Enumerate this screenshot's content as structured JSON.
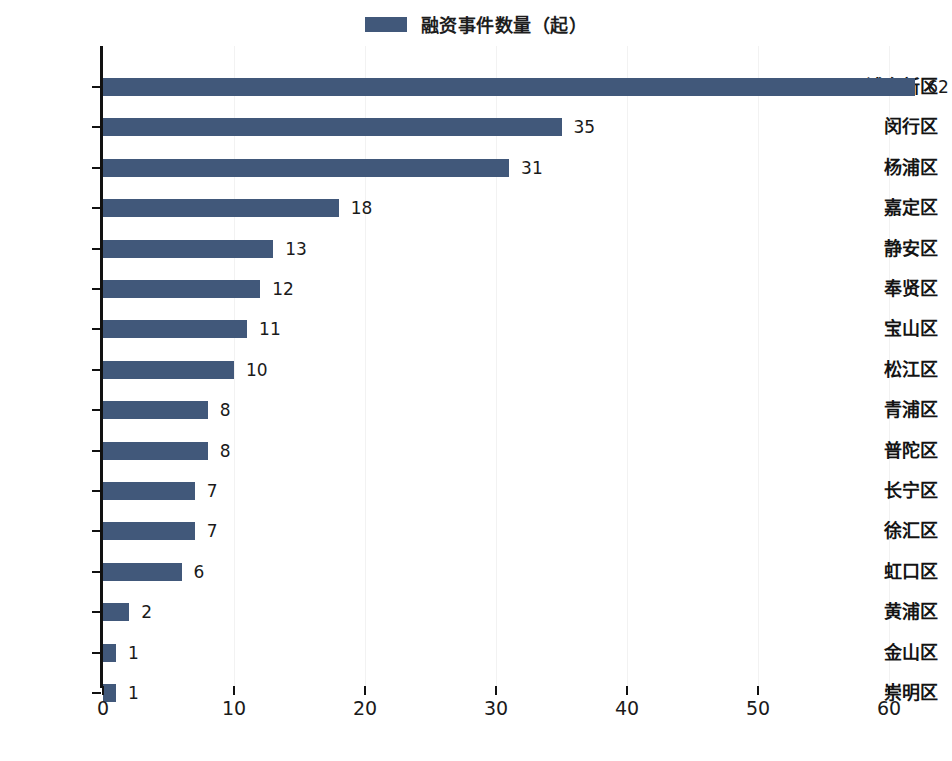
{
  "legend": {
    "entries": [
      {
        "label": "融资事件数量（起）",
        "color": "#41587a"
      }
    ]
  },
  "axis": {
    "x_ticks": [
      "0",
      "10",
      "20",
      "30",
      "40",
      "50",
      "60"
    ],
    "x_tick_values": [
      0,
      10,
      20,
      30,
      40,
      50,
      60
    ]
  },
  "chart_data": {
    "type": "bar",
    "orientation": "horizontal",
    "title": "",
    "subtitle": "",
    "xlabel": "",
    "ylabel": "",
    "xlim": [
      0,
      65
    ],
    "grid": "vertical-faint",
    "legend_position": "top-center",
    "bar_color": "#41587a",
    "categories": [
      "浦东新区",
      "闵行区",
      "杨浦区",
      "嘉定区",
      "静安区",
      "奉贤区",
      "宝山区",
      "松江区",
      "青浦区",
      "普陀区",
      "长宁区",
      "徐汇区",
      "虹口区",
      "黄浦区",
      "金山区",
      "崇明区"
    ],
    "series": [
      {
        "name": "融资事件数量（起）",
        "values": [
          62,
          35,
          31,
          18,
          13,
          12,
          11,
          10,
          8,
          8,
          7,
          7,
          6,
          2,
          1,
          1
        ]
      }
    ],
    "data_labels": [
      "62",
      "35",
      "31",
      "18",
      "13",
      "12",
      "11",
      "10",
      "8",
      "8",
      "7",
      "7",
      "6",
      "2",
      "1",
      "1"
    ],
    "tick_labels_x": [
      "0",
      "10",
      "20",
      "30",
      "40",
      "50",
      "60"
    ]
  }
}
